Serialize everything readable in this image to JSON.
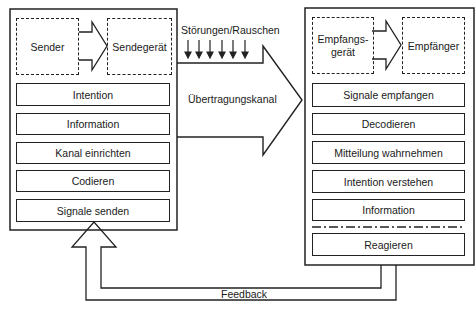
{
  "sender_panel": {
    "sender": "Sender",
    "device": "Sendegerät",
    "steps": [
      "Intention",
      "Information",
      "Kanal einrichten",
      "Codieren",
      "Signale senden"
    ]
  },
  "channel": {
    "noise_label": "Störungen/Rauschen",
    "label": "Übertragungskanal",
    "noise_arrow_count": 6
  },
  "receiver_panel": {
    "device_line1": "Empfangs-",
    "device_line2": "gerät",
    "receiver": "Empfänger",
    "steps": [
      "Signale empfangen",
      "Decodieren",
      "Mitteilung wahrnehmen",
      "Intention verstehen",
      "Information"
    ],
    "final_step": "Reagieren"
  },
  "feedback": {
    "label": "Feedback"
  },
  "colors": {
    "line": "#222222",
    "background": "#ffffff"
  }
}
